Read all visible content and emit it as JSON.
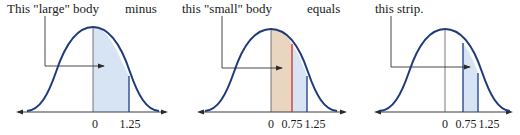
{
  "colors": {
    "curve": "#1f3a7a",
    "axis": "#3a3a3a",
    "blue_fill": "#d6e4f3",
    "tan_fill": "#ead5c1",
    "red_line": "#d23a3a",
    "boundary": "#2a4a8a"
  },
  "panels": [
    {
      "caption": "This \"large\" body",
      "connector": "minus",
      "ticks": [
        "0",
        "1.25"
      ],
      "shaded_region": "0 to 1.25"
    },
    {
      "caption": "this \"small\" body",
      "connector": "equals",
      "ticks": [
        "0",
        "0.75",
        "1.25"
      ],
      "shaded_region": "0 to 0.75 (tan), 0.75 to 1.25 (blue)"
    },
    {
      "caption": "this strip.",
      "connector": "",
      "ticks": [
        "0",
        "0.75",
        "1.25"
      ],
      "shaded_region": "0.75 to 1.25"
    }
  ]
}
